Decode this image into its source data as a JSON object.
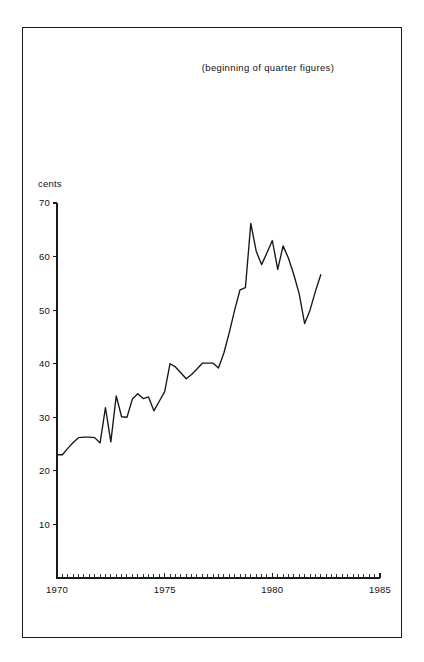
{
  "figure": {
    "note": "(beginning of quarter figures)",
    "background_color": "#ffffff",
    "frame_color": "#1a1a1a",
    "line_color": "#161616"
  },
  "chart_data": {
    "type": "line",
    "title": "",
    "subtitle": "(beginning of quarter figures)",
    "xlabel": "",
    "ylabel": "cents",
    "ylim": [
      0,
      70
    ],
    "xlim": [
      1970,
      1985
    ],
    "grid": false,
    "legend": false,
    "y_unit_label": "cents",
    "y_ticks": [
      10,
      20,
      30,
      40,
      50,
      60,
      70
    ],
    "y_tick_labels": [
      "10",
      "20",
      "30",
      "40",
      "50",
      "60",
      "70"
    ],
    "x_ticks": [
      1970,
      1975,
      1980,
      1985
    ],
    "x_tick_labels": [
      "1970",
      "1975",
      "1980",
      "1985"
    ],
    "x_minor_tick_interval": 0.25,
    "x_minor_tick_note": "quarterly ticks across full 1970-1985 axis",
    "series": [
      {
        "name": "cents per unit",
        "x": [
          1970.0,
          1970.25,
          1970.5,
          1970.75,
          1971.0,
          1971.25,
          1971.5,
          1971.75,
          1972.0,
          1972.25,
          1972.5,
          1972.75,
          1973.0,
          1973.25,
          1973.5,
          1973.75,
          1974.0,
          1974.25,
          1974.5,
          1974.75,
          1975.0,
          1975.25,
          1975.5,
          1975.75,
          1976.0,
          1976.25,
          1976.5,
          1976.75,
          1977.0,
          1977.25,
          1977.5,
          1977.75,
          1978.0,
          1978.25,
          1978.5,
          1978.75,
          1979.0,
          1979.25,
          1979.5,
          1979.75,
          1980.0,
          1980.25,
          1980.5,
          1980.75,
          1981.0,
          1981.25,
          1981.5,
          1981.75,
          1982.0,
          1982.25
        ],
        "values": [
          23.0,
          23.0,
          24.2,
          25.3,
          26.2,
          26.3,
          26.3,
          26.2,
          25.2,
          31.8,
          25.4,
          34.0,
          30.1,
          30.0,
          33.4,
          34.4,
          33.5,
          33.8,
          31.2,
          33.0,
          34.8,
          40.0,
          39.4,
          38.3,
          37.2,
          38.0,
          39.0,
          40.1,
          40.1,
          40.1,
          39.2,
          42.0,
          45.8,
          50.0,
          53.8,
          54.2,
          66.2,
          61.0,
          58.5,
          60.7,
          63.0,
          57.6,
          62.0,
          59.7,
          56.6,
          53.0,
          47.5,
          50.0,
          53.5,
          56.6
        ]
      }
    ]
  },
  "axes_geometry": {
    "plot_left_px": 57,
    "plot_bottom_px": 578,
    "plot_right_px": 380,
    "y70_px": 203,
    "y_value_max": 70,
    "x_value_min": 1970,
    "x_value_max": 1985
  }
}
